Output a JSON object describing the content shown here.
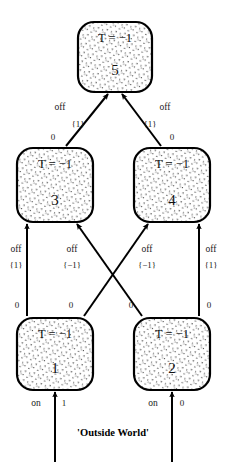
{
  "diagram": {
    "type": "state-transition-graph",
    "caption": "'Outside World'",
    "nodes": [
      {
        "id": "1",
        "label": "1",
        "condition": "T = −1",
        "x": 17,
        "y": 318,
        "w": 76,
        "h": 72
      },
      {
        "id": "2",
        "label": "2",
        "condition": "T = −1",
        "x": 134,
        "y": 318,
        "w": 76,
        "h": 72
      },
      {
        "id": "3",
        "label": "3",
        "condition": "T = −1",
        "x": 17,
        "y": 148,
        "w": 76,
        "h": 74
      },
      {
        "id": "4",
        "label": "4",
        "condition": "T = −1",
        "x": 134,
        "y": 148,
        "w": 76,
        "h": 74
      },
      {
        "id": "5",
        "label": "5",
        "condition": "T = −1",
        "x": 78,
        "y": 22,
        "w": 74,
        "h": 70
      }
    ],
    "edges": [
      {
        "from": "3",
        "to": "5",
        "event": "off",
        "output": "{1}",
        "tail_label": "0",
        "x1": 66,
        "y1": 146,
        "x2": 108,
        "y2": 94,
        "event_x": 60,
        "event_y": 108,
        "output_x": 78,
        "output_y": 125,
        "tail_x": 53,
        "tail_y": 138
      },
      {
        "from": "4",
        "to": "5",
        "event": "off",
        "output": "{1}",
        "tail_label": "0",
        "x1": 161,
        "y1": 146,
        "x2": 122,
        "y2": 94,
        "event_x": 165,
        "event_y": 108,
        "output_x": 150,
        "output_y": 125,
        "tail_x": 172,
        "tail_y": 138
      },
      {
        "from": "1",
        "to": "3",
        "event": "off",
        "output": "{1}",
        "tail_label": "0",
        "x1": 27,
        "y1": 316,
        "x2": 27,
        "y2": 224,
        "event_x": 16,
        "event_y": 250,
        "output_x": 16,
        "output_y": 266,
        "tail_x": 17,
        "tail_y": 306
      },
      {
        "from": "2",
        "to": "3",
        "event": "off",
        "output": "{−1}",
        "tail_label": "0",
        "x1": 142,
        "y1": 316,
        "x2": 77,
        "y2": 224,
        "event_x": 72,
        "event_y": 250,
        "output_x": 72,
        "output_y": 266,
        "tail_x": 131,
        "tail_y": 306
      },
      {
        "from": "1",
        "to": "4",
        "event": "off",
        "output": "{−1}",
        "tail_label": "0",
        "x1": 84,
        "y1": 316,
        "x2": 148,
        "y2": 224,
        "event_x": 147,
        "event_y": 250,
        "output_x": 147,
        "output_y": 266,
        "tail_x": 71,
        "tail_y": 306
      },
      {
        "from": "2",
        "to": "4",
        "event": "off",
        "output": "{1}",
        "tail_label": "0",
        "x1": 199,
        "y1": 316,
        "x2": 199,
        "y2": 224,
        "event_x": 211,
        "event_y": 250,
        "output_x": 211,
        "output_y": 266,
        "tail_x": 209,
        "tail_y": 306
      }
    ],
    "inputs": [
      {
        "to": "1",
        "event": "on",
        "value": "1",
        "x": 55,
        "y_start": 462,
        "y_end": 392,
        "event_x": 36,
        "event_y": 404,
        "value_x": 64,
        "value_y": 404
      },
      {
        "to": "2",
        "event": "on",
        "value": "0",
        "x": 172,
        "y_start": 462,
        "y_end": 392,
        "event_x": 153,
        "event_y": 404,
        "value_x": 182,
        "value_y": 404
      }
    ],
    "caption_x": 113,
    "caption_y": 434,
    "colors": {
      "stroke": "#000000",
      "fill": "#ffffff",
      "text": "#111111",
      "stipple": "#3a3a3a"
    }
  }
}
